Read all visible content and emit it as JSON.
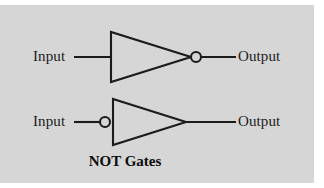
{
  "figure": {
    "caption": "NOT Gates",
    "background_color": "#d6d6d6",
    "page_color": "#ffffff",
    "stroke_color": "#1b1b1b",
    "text_color": "#1b1b1b"
  },
  "gates": [
    {
      "id": "not-gate-top",
      "type": "NOT",
      "input_label": "Input",
      "output_label": "Output",
      "bubble_side": "output"
    },
    {
      "id": "not-gate-bottom",
      "type": "NOT",
      "input_label": "Input",
      "output_label": "Output",
      "bubble_side": "input"
    }
  ]
}
